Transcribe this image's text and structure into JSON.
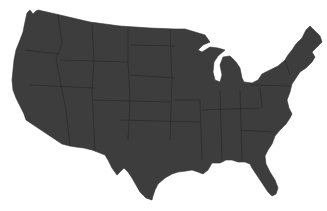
{
  "map": {
    "subject": "Contiguous United States silhouette",
    "style": "grayscale",
    "colors": {
      "land": "#3d3d3d",
      "borders": "#232323",
      "background": "#ffffff"
    },
    "labels": []
  }
}
